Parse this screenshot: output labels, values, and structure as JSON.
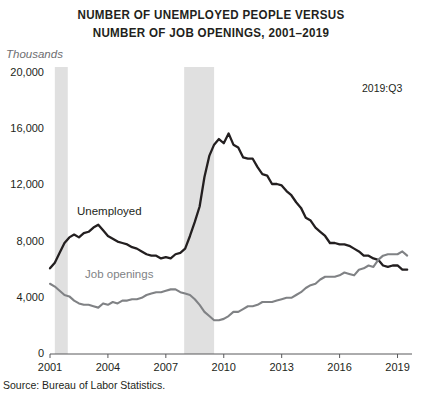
{
  "chart_data": {
    "type": "line",
    "title_lines": [
      "NUMBER OF UNEMPLOYED PEOPLE VERSUS",
      "NUMBER OF JOB OPENINGS, 2001–2019"
    ],
    "unit_label": "Thousands",
    "annotation": "2019:Q3",
    "source": "Source: Bureau of Labor Statistics.",
    "xlabel": "",
    "ylabel": "Thousands",
    "ylim": [
      0,
      20000
    ],
    "xlim": [
      2001,
      2019.75
    ],
    "grid": false,
    "legend_position": "inline-labels",
    "y_ticks": [
      0,
      4000,
      8000,
      12000,
      16000,
      20000
    ],
    "y_tick_labels": [
      "0",
      "4,000",
      "8,000",
      "12,000",
      "16,000",
      "20,000"
    ],
    "x_ticks": [
      2001,
      2004,
      2007,
      2010,
      2013,
      2016,
      2019
    ],
    "x_tick_labels": [
      "2001",
      "2004",
      "2007",
      "2010",
      "2013",
      "2016",
      "2019"
    ],
    "shaded_regions": [
      {
        "name": "recession-2001",
        "x0": 2001.25,
        "x1": 2001.92,
        "color": "#e0e0e0"
      },
      {
        "name": "recession-2008",
        "x0": 2007.95,
        "x1": 2009.5,
        "color": "#e0e0e0"
      }
    ],
    "series": [
      {
        "name": "Unemployed",
        "color": "#231f20",
        "x": [
          2001.0,
          2001.25,
          2001.5,
          2001.75,
          2002.0,
          2002.25,
          2002.5,
          2002.75,
          2003.0,
          2003.25,
          2003.5,
          2003.75,
          2004.0,
          2004.25,
          2004.5,
          2004.75,
          2005.0,
          2005.25,
          2005.5,
          2005.75,
          2006.0,
          2006.25,
          2006.5,
          2006.75,
          2007.0,
          2007.25,
          2007.5,
          2007.75,
          2008.0,
          2008.25,
          2008.5,
          2008.75,
          2009.0,
          2009.25,
          2009.5,
          2009.75,
          2010.0,
          2010.25,
          2010.5,
          2010.75,
          2011.0,
          2011.25,
          2011.5,
          2011.75,
          2012.0,
          2012.25,
          2012.5,
          2012.75,
          2013.0,
          2013.25,
          2013.5,
          2013.75,
          2014.0,
          2014.25,
          2014.5,
          2014.75,
          2015.0,
          2015.25,
          2015.5,
          2015.75,
          2016.0,
          2016.25,
          2016.5,
          2016.75,
          2017.0,
          2017.25,
          2017.5,
          2017.75,
          2018.0,
          2018.25,
          2018.5,
          2018.75,
          2019.0,
          2019.25,
          2019.5
        ],
        "values": [
          6100,
          6500,
          7200,
          7900,
          8300,
          8500,
          8300,
          8600,
          8700,
          9000,
          9200,
          8800,
          8400,
          8200,
          8000,
          7900,
          7800,
          7600,
          7500,
          7300,
          7100,
          7000,
          7000,
          6800,
          6900,
          6800,
          7100,
          7200,
          7500,
          8400,
          9400,
          10500,
          12600,
          14100,
          14900,
          15300,
          15000,
          15700,
          14900,
          14700,
          14000,
          13900,
          13900,
          13300,
          12800,
          12700,
          12100,
          12100,
          12000,
          11600,
          11300,
          10800,
          10400,
          9700,
          9500,
          9000,
          8700,
          8400,
          7900,
          7900,
          7800,
          7800,
          7700,
          7500,
          7300,
          7000,
          7000,
          6800,
          6700,
          6300,
          6200,
          6300,
          6300,
          6000,
          6000
        ]
      },
      {
        "name": "Job openings",
        "color": "#808285",
        "x": [
          2001.0,
          2001.25,
          2001.5,
          2001.75,
          2002.0,
          2002.25,
          2002.5,
          2002.75,
          2003.0,
          2003.25,
          2003.5,
          2003.75,
          2004.0,
          2004.25,
          2004.5,
          2004.75,
          2005.0,
          2005.25,
          2005.5,
          2005.75,
          2006.0,
          2006.25,
          2006.5,
          2006.75,
          2007.0,
          2007.25,
          2007.5,
          2007.75,
          2008.0,
          2008.25,
          2008.5,
          2008.75,
          2009.0,
          2009.25,
          2009.5,
          2009.75,
          2010.0,
          2010.25,
          2010.5,
          2010.75,
          2011.0,
          2011.25,
          2011.5,
          2011.75,
          2012.0,
          2012.25,
          2012.5,
          2012.75,
          2013.0,
          2013.25,
          2013.5,
          2013.75,
          2014.0,
          2014.25,
          2014.5,
          2014.75,
          2015.0,
          2015.25,
          2015.5,
          2015.75,
          2016.0,
          2016.25,
          2016.5,
          2016.75,
          2017.0,
          2017.25,
          2017.5,
          2017.75,
          2018.0,
          2018.25,
          2018.5,
          2018.75,
          2019.0,
          2019.25,
          2019.5
        ],
        "values": [
          5000,
          4800,
          4500,
          4200,
          4100,
          3800,
          3600,
          3500,
          3500,
          3400,
          3300,
          3600,
          3500,
          3700,
          3600,
          3800,
          3800,
          3900,
          3900,
          4000,
          4200,
          4300,
          4400,
          4400,
          4500,
          4600,
          4600,
          4400,
          4300,
          4200,
          3900,
          3500,
          3000,
          2700,
          2400,
          2400,
          2500,
          2700,
          3000,
          3000,
          3200,
          3400,
          3400,
          3500,
          3700,
          3700,
          3700,
          3800,
          3900,
          4000,
          4000,
          4200,
          4400,
          4700,
          4900,
          5000,
          5300,
          5500,
          5500,
          5500,
          5600,
          5800,
          5700,
          5600,
          6000,
          6100,
          6300,
          6200,
          6700,
          7000,
          7100,
          7100,
          7100,
          7300,
          7000
        ]
      }
    ]
  },
  "plot_geometry": {
    "left": 50,
    "right": 412,
    "top": 73,
    "bottom": 354
  }
}
